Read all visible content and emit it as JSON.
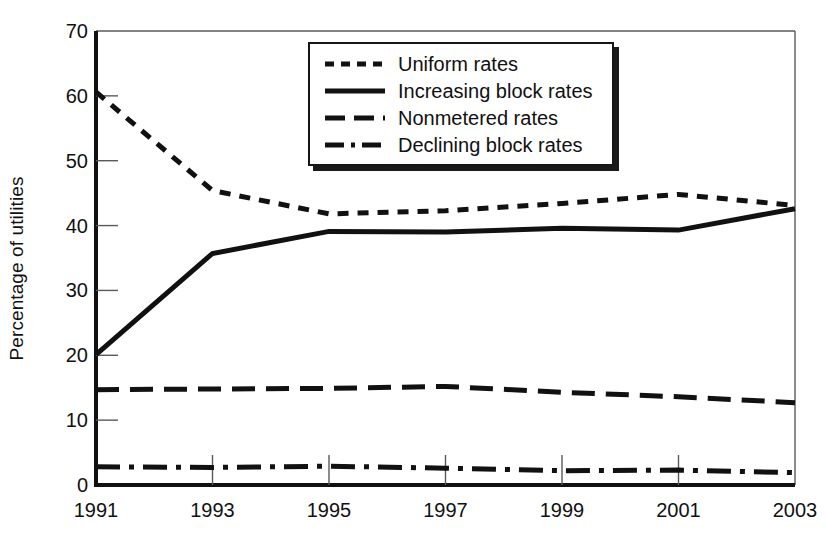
{
  "chart_data": {
    "type": "line",
    "title": "",
    "subtitle": "",
    "xlabel": "",
    "ylabel": "Percentage of utilities",
    "x": [
      1991,
      1993,
      1995,
      1997,
      1999,
      2001,
      2003
    ],
    "xtick_labels": [
      "1991",
      "1993",
      "1995",
      "1997",
      "1999",
      "2001",
      "2003"
    ],
    "ytick_labels": [
      "0",
      "10",
      "20",
      "30",
      "40",
      "50",
      "60",
      "70"
    ],
    "ytick_values": [
      0,
      10,
      20,
      30,
      40,
      50,
      60,
      70
    ],
    "xlim": [
      1991,
      2003
    ],
    "ylim": [
      0,
      70
    ],
    "grid": false,
    "legend_position": "top-center",
    "series": [
      {
        "name": "Uniform rates",
        "style": "dotted",
        "color": "#111111",
        "values": [
          60.6,
          45.4,
          41.8,
          42.3,
          43.4,
          44.8,
          43.1
        ]
      },
      {
        "name": "Increasing block rates",
        "style": "solid",
        "color": "#111111",
        "values": [
          20.1,
          35.7,
          39.1,
          39.0,
          39.6,
          39.3,
          42.6
        ]
      },
      {
        "name": "Nonmetered rates",
        "style": "dashed",
        "color": "#111111",
        "values": [
          14.7,
          14.8,
          14.9,
          15.2,
          14.3,
          13.6,
          12.7
        ]
      },
      {
        "name": "Declining block rates",
        "style": "dash-dot",
        "color": "#111111",
        "values": [
          2.8,
          2.7,
          2.9,
          2.6,
          2.2,
          2.3,
          1.9
        ]
      }
    ]
  },
  "legend": {
    "items": [
      {
        "label": "Uniform rates",
        "style": "dotted"
      },
      {
        "label": "Increasing block rates",
        "style": "solid"
      },
      {
        "label": "Nonmetered rates",
        "style": "dashed"
      },
      {
        "label": "Declining block rates",
        "style": "dash-dot"
      }
    ]
  },
  "axes": {
    "y_title": "Percentage of utilities"
  },
  "colors": {
    "ink": "#111111",
    "frame": "#5a5a5a",
    "background": "#ffffff"
  }
}
